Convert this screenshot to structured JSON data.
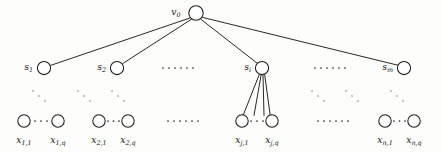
{
  "figure": {
    "type": "graph-diagram",
    "name": "rooted-tree-three-levels",
    "background_color": "#fdfdfc",
    "stroke_color": "#1b1b1b",
    "node_fill": "#ffffff"
  },
  "levels": {
    "root": {
      "label_main": "v",
      "label_sub": "0",
      "cx": 196,
      "cy": 13,
      "r": 7.2
    },
    "middle": {
      "r": 6.6,
      "cy": 68,
      "nodes": [
        {
          "label_main": "s",
          "label_sub": "1",
          "cx": 44
        },
        {
          "label_main": "s",
          "label_sub": "2",
          "cx": 117
        },
        {
          "label_main": "s",
          "label_sub": "i",
          "cx": 262
        },
        {
          "label_main": "s",
          "label_sub": "m",
          "cx": 404
        }
      ]
    },
    "leaves": {
      "r": 6.2,
      "cy": 121,
      "groups": [
        {
          "left": {
            "label_main": "x",
            "label_sub": "1,1",
            "cx": 24
          },
          "right": {
            "label_main": "x",
            "label_sub": "1,q",
            "cx": 58
          }
        },
        {
          "left": {
            "label_main": "x",
            "label_sub": "2,1",
            "cx": 99
          },
          "right": {
            "label_main": "x",
            "label_sub": "2,q",
            "cx": 127
          }
        },
        {
          "left": {
            "label_main": "x",
            "label_sub": "j,1",
            "cx": 242
          },
          "right": {
            "label_main": "x",
            "label_sub": "j,q",
            "cx": 271
          }
        },
        {
          "left": {
            "label_main": "x",
            "label_sub": "n,1",
            "cx": 385
          },
          "right": {
            "label_main": "x",
            "label_sub": "n,q",
            "cx": 413
          }
        }
      ]
    }
  },
  "ellipses": {
    "middle_row": [
      {
        "name": "middle-row-ellipsis-left",
        "cx": 178,
        "cy": 68,
        "dots": 6
      },
      {
        "name": "middle-row-ellipsis-right",
        "cx": 330,
        "cy": 68,
        "dots": 6
      }
    ],
    "leaf_row": [
      {
        "name": "leaf-row-ellipsis-left",
        "cx": 183,
        "cy": 121,
        "dots": 6
      },
      {
        "name": "leaf-row-ellipsis-right",
        "cx": 333,
        "cy": 121,
        "dots": 6
      }
    ],
    "intra_group": [
      {
        "name": "group-1-ellipsis",
        "cx": 41,
        "cy": 121,
        "dots": 3
      },
      {
        "name": "group-2-ellipsis",
        "cx": 113,
        "cy": 121,
        "dots": 3
      },
      {
        "name": "group-3-ellipsis",
        "cx": 256,
        "cy": 121,
        "dots": 3
      },
      {
        "name": "group-4-ellipsis",
        "cx": 399,
        "cy": 121,
        "dots": 3
      }
    ],
    "diagonal": [
      {
        "name": "diagonal-dots-1",
        "cx": 39,
        "cy": 96
      },
      {
        "name": "diagonal-dots-2",
        "cx": 84,
        "cy": 96
      },
      {
        "name": "diagonal-dots-3",
        "cx": 118,
        "cy": 96
      },
      {
        "name": "diagonal-dots-4",
        "cx": 318,
        "cy": 96
      },
      {
        "name": "diagonal-dots-5",
        "cx": 352,
        "cy": 96
      },
      {
        "name": "diagonal-dots-6",
        "cx": 397,
        "cy": 96
      }
    ]
  },
  "edges": {
    "root_to_middle": [
      {
        "from": "root",
        "to": "s_1"
      },
      {
        "from": "root",
        "to": "s_2"
      },
      {
        "from": "root",
        "to": "s_i"
      },
      {
        "from": "root",
        "to": "s_m"
      }
    ],
    "si_to_leaves": [
      {
        "from": "s_i",
        "to": "x_j_1"
      },
      {
        "from": "s_i",
        "to": "x_j_mid_left"
      },
      {
        "from": "s_i",
        "to": "x_j_mid_right"
      },
      {
        "from": "s_i",
        "to": "x_j_q"
      }
    ]
  }
}
